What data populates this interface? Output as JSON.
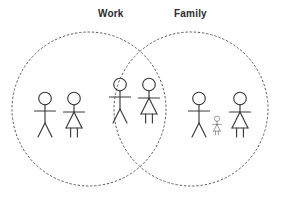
{
  "diagram": {
    "type": "venn",
    "title": "",
    "background_color": "#ffffff",
    "stroke_color": "#5a5a5a",
    "figure_color": "#3a3a3a",
    "label_color": "#2b2b2b",
    "sets": [
      {
        "id": "work",
        "label": "Work",
        "label_x": 98,
        "label_y": 8,
        "circle": {
          "cx": 89,
          "cy": 109,
          "r": 77
        },
        "style": "dashed"
      },
      {
        "id": "family",
        "label": "Family",
        "label_x": 174,
        "label_y": 8,
        "circle": {
          "cx": 191,
          "cy": 109,
          "r": 77
        },
        "style": "dashed"
      }
    ],
    "regions": [
      {
        "id": "work-only",
        "name": "work-only-region",
        "figures": [
          {
            "kind": "adult-male",
            "name": "stick-figure-male",
            "x": 45,
            "y": 92,
            "scale": 1.0
          },
          {
            "kind": "adult-female",
            "name": "stick-figure-female",
            "x": 74,
            "y": 92,
            "scale": 1.0
          }
        ]
      },
      {
        "id": "work-family-overlap",
        "name": "overlap-region",
        "figures": [
          {
            "kind": "adult-male",
            "name": "stick-figure-male",
            "x": 120,
            "y": 78,
            "scale": 1.0
          },
          {
            "kind": "adult-female",
            "name": "stick-figure-female",
            "x": 149,
            "y": 78,
            "scale": 1.0
          }
        ]
      },
      {
        "id": "family-only",
        "name": "family-only-region",
        "figures": [
          {
            "kind": "adult-male",
            "name": "stick-figure-male",
            "x": 199,
            "y": 92,
            "scale": 1.0
          },
          {
            "kind": "child-female",
            "name": "stick-figure-child",
            "x": 217,
            "y": 116,
            "scale": 0.42
          },
          {
            "kind": "adult-female",
            "name": "stick-figure-female",
            "x": 240,
            "y": 92,
            "scale": 1.0
          }
        ]
      }
    ]
  }
}
